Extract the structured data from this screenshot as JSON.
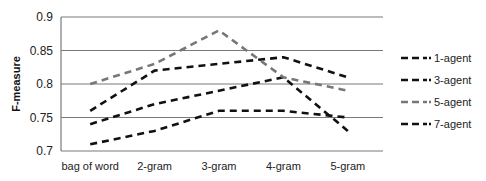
{
  "chart_data": {
    "type": "line",
    "title": "",
    "xlabel": "",
    "ylabel": "F-measure",
    "ylim": [
      0.7,
      0.9
    ],
    "yticks": [
      "0.7",
      "0.75",
      "0.8",
      "0.85",
      "0.9"
    ],
    "grid": true,
    "legend_position": "right",
    "categories": [
      "bag of word",
      "2-gram",
      "3-gram",
      "4-gram",
      "5-gram"
    ],
    "series": [
      {
        "name": "1-agent",
        "color": "#111111",
        "values": [
          0.76,
          0.82,
          0.83,
          0.84,
          0.81
        ]
      },
      {
        "name": "3-agent",
        "color": "#111111",
        "values": [
          0.74,
          0.77,
          0.79,
          0.81,
          0.73
        ]
      },
      {
        "name": "5-agent",
        "color": "#777777",
        "values": [
          0.8,
          0.83,
          0.88,
          0.81,
          0.79
        ]
      },
      {
        "name": "7-agent",
        "color": "#111111",
        "values": [
          0.71,
          0.73,
          0.76,
          0.76,
          0.75
        ]
      }
    ]
  }
}
